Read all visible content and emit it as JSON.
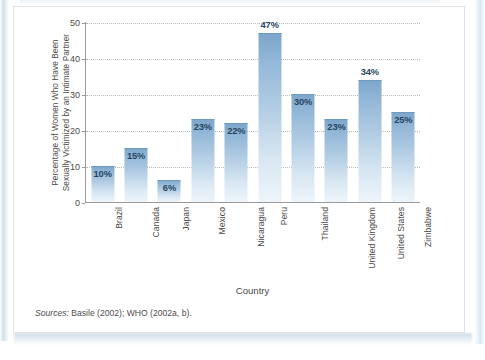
{
  "figure": {
    "y_axis_title_line1": "Percentage of Women Who Have Been",
    "y_axis_title_line2": "Sexually Victimized by an Intimate Partner",
    "x_axis_title": "Country",
    "source_label": "Sources:",
    "source_text": " Basile (2002); WHO (2002a, b)."
  },
  "colors": {
    "bar_top": "#7ba5ca",
    "bar_bottom": "#eef5fb",
    "value_label": "#27455f",
    "axis": "#9a9a9a",
    "gridline": "#b9b9b9",
    "page_edge": "#cfdfec"
  },
  "chart_data": {
    "type": "bar",
    "title": "",
    "xlabel": "Country",
    "ylabel": "Percentage of Women Who Have Been Sexually Victimized by an Intimate Partner",
    "ylim": [
      0,
      50
    ],
    "yticks": [
      0,
      10,
      20,
      30,
      40,
      50
    ],
    "ytick_labels": [
      "0",
      "10",
      "20",
      "30",
      "40",
      "50"
    ],
    "grid": true,
    "legend": false,
    "categories": [
      "Brazil",
      "Canada",
      "Japan",
      "Mexico",
      "Nicaragua",
      "Peru",
      "Thailand",
      "United Kingdom",
      "United States",
      "Zimbabwe"
    ],
    "values": [
      10,
      15,
      6,
      23,
      22,
      47,
      30,
      23,
      34,
      25
    ],
    "data_labels": [
      "10%",
      "15%",
      "6%",
      "23%",
      "22%",
      "47%",
      "30%",
      "23%",
      "34%",
      "25%"
    ],
    "label_position": [
      "inside",
      "inside",
      "inside",
      "inside",
      "inside",
      "above",
      "inside",
      "inside",
      "above",
      "inside"
    ]
  }
}
